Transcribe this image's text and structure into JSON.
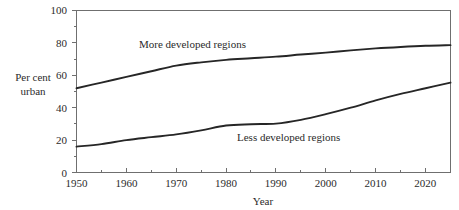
{
  "chart_data": {
    "type": "line",
    "title": "",
    "xlabel": "Year",
    "ylabel": "Per cent urban",
    "ylabel_line1": "Per cent",
    "ylabel_line2": "urban",
    "xlim": [
      1950,
      2025
    ],
    "ylim": [
      0,
      100
    ],
    "grid": false,
    "legend": "inline-annotations",
    "x_ticks": [
      1950,
      1960,
      1970,
      1980,
      1990,
      2000,
      2010,
      2020
    ],
    "x_tick_labels": [
      "1950",
      "1960",
      "1970",
      "1980",
      "1990",
      "2000",
      "2010",
      "2020"
    ],
    "x_minor_tick_step": 5,
    "y_ticks": [
      0,
      20,
      40,
      60,
      80,
      100
    ],
    "y_tick_labels": [
      "0",
      "20",
      "40",
      "60",
      "80",
      "100"
    ],
    "y_minor_tick_step": 10,
    "series": [
      {
        "name": "More developed regions",
        "annotation": "More developed regions",
        "color": "#262626",
        "x": [
          1950,
          1955,
          1960,
          1965,
          1970,
          1975,
          1980,
          1985,
          1990,
          1995,
          2000,
          2005,
          2010,
          2015,
          2020,
          2025
        ],
        "values": [
          52,
          55.5,
          59,
          62.5,
          66,
          68,
          69.5,
          70.5,
          71.5,
          72.8,
          74,
          75.4,
          76.6,
          77.5,
          78.2,
          78.6
        ]
      },
      {
        "name": "Less developed regions",
        "annotation": "Less developed regions",
        "color": "#262626",
        "x": [
          1950,
          1955,
          1960,
          1965,
          1970,
          1975,
          1980,
          1985,
          1990,
          1995,
          2000,
          2005,
          2010,
          2015,
          2020,
          2025
        ],
        "values": [
          16,
          17.5,
          20,
          21.8,
          23.5,
          26,
          29,
          29.8,
          30.2,
          32.5,
          36,
          40,
          44.5,
          48.5,
          52,
          55.5
        ]
      }
    ],
    "annotations": [
      {
        "text": "More developed regions",
        "x_px": 139,
        "y_px": 48
      },
      {
        "text": "Less developed regions",
        "x_px": 237,
        "y_px": 141
      }
    ]
  }
}
